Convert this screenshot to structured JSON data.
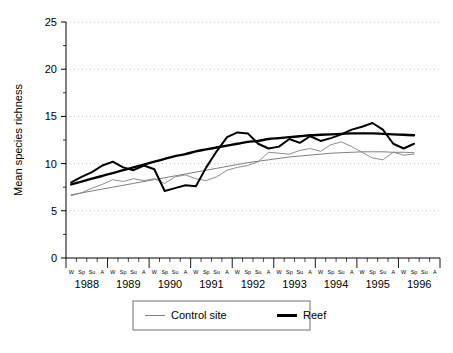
{
  "chart_data": {
    "type": "line",
    "title": "",
    "xlabel": "",
    "ylabel": "Mean species richness",
    "ylim": [
      0,
      25
    ],
    "yticks": [
      0,
      5,
      10,
      15,
      20,
      25
    ],
    "grid": true,
    "grid_style": "dotted horizontal",
    "legend_position": "bottom",
    "years": [
      "1988",
      "1989",
      "1990",
      "1991",
      "1992",
      "1993",
      "1994",
      "1995",
      "1996"
    ],
    "season_labels": [
      "W",
      "Sp",
      "Su",
      "A"
    ],
    "x": [
      "1988-W",
      "1988-Sp",
      "1988-Su",
      "1988-A",
      "1989-W",
      "1989-Sp",
      "1989-Su",
      "1989-A",
      "1990-W",
      "1990-Sp",
      "1990-Su",
      "1990-A",
      "1991-W",
      "1991-Sp",
      "1991-Su",
      "1991-A",
      "1992-W",
      "1992-Sp",
      "1992-Su",
      "1992-A",
      "1993-W",
      "1993-Sp",
      "1993-Su",
      "1993-A",
      "1994-W",
      "1994-Sp",
      "1994-Su",
      "1994-A",
      "1995-W",
      "1995-Sp",
      "1995-Su",
      "1995-A",
      "1996-W",
      "1996-Sp"
    ],
    "series": [
      {
        "name": "Reef",
        "style": "thick solid black",
        "color": "#000000",
        "values": [
          8.0,
          8.6,
          9.1,
          9.8,
          10.2,
          9.6,
          9.3,
          9.8,
          9.4,
          7.1,
          7.4,
          7.7,
          7.6,
          9.6,
          11.3,
          12.8,
          13.3,
          13.2,
          12.1,
          11.6,
          11.8,
          12.6,
          12.2,
          12.9,
          12.4,
          12.7,
          13.1,
          13.6,
          13.9,
          14.3,
          13.6,
          12.1,
          11.6,
          12.1
        ]
      },
      {
        "name": "Control site",
        "style": "thin solid grey",
        "color": "#808080",
        "values": [
          6.6,
          6.9,
          7.4,
          7.8,
          8.3,
          8.1,
          8.4,
          8.2,
          8.4,
          7.9,
          8.6,
          8.8,
          8.4,
          8.2,
          8.6,
          9.3,
          9.6,
          9.8,
          10.2,
          11.2,
          11.1,
          11.0,
          11.4,
          11.6,
          11.3,
          12.0,
          12.3,
          11.8,
          11.2,
          10.6,
          10.4,
          11.2,
          10.9,
          11.0
        ]
      }
    ],
    "trend_lines": [
      {
        "name": "Reef trend",
        "style": "thick smooth black",
        "color": "#000000",
        "values": [
          7.8,
          8.1,
          8.4,
          8.7,
          9.0,
          9.3,
          9.6,
          9.9,
          10.2,
          10.5,
          10.8,
          11.0,
          11.3,
          11.5,
          11.7,
          11.9,
          12.1,
          12.3,
          12.4,
          12.6,
          12.7,
          12.8,
          12.9,
          13.0,
          13.05,
          13.1,
          13.15,
          13.2,
          13.2,
          13.2,
          13.15,
          13.1,
          13.05,
          13.0
        ]
      },
      {
        "name": "Control site trend",
        "style": "thin smooth grey",
        "color": "#808080",
        "values": [
          6.7,
          6.9,
          7.1,
          7.3,
          7.5,
          7.7,
          7.9,
          8.1,
          8.3,
          8.5,
          8.7,
          8.9,
          9.1,
          9.3,
          9.5,
          9.7,
          9.9,
          10.1,
          10.25,
          10.4,
          10.55,
          10.7,
          10.8,
          10.9,
          11.0,
          11.1,
          11.15,
          11.2,
          11.25,
          11.25,
          11.25,
          11.2,
          11.2,
          11.15
        ]
      }
    ],
    "legend": [
      {
        "label": "Control site",
        "color": "#808080",
        "width": 1
      },
      {
        "label": "Reef",
        "color": "#000000",
        "width": 3
      }
    ]
  }
}
